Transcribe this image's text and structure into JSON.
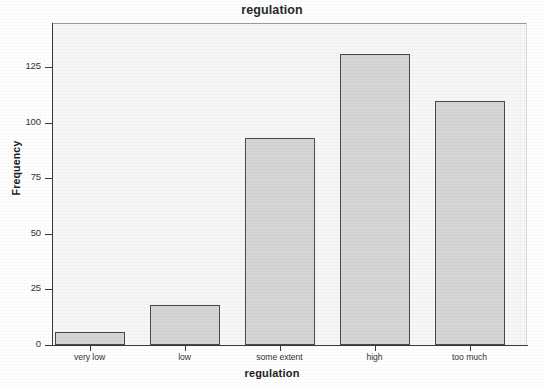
{
  "chart_data": {
    "type": "bar",
    "title": "regulation",
    "xlabel": "regulation",
    "ylabel": "Frequency",
    "categories": [
      "very low",
      "low",
      "some extent",
      "high",
      "too much"
    ],
    "values": [
      6,
      18,
      93,
      131,
      110
    ],
    "ylim": [
      0,
      145
    ],
    "yticks": [
      0,
      25,
      50,
      75,
      100,
      125
    ],
    "ytick_labels": [
      "0",
      "25",
      "50",
      "75",
      "100",
      "125"
    ],
    "grid": false,
    "legend": null,
    "bar_fill_color": "#d6d6d6",
    "bar_border_color": "#4a4a4a",
    "plot_background_color": "#f7f7f7",
    "figure_background_color": "#ffffff",
    "axis_color": "#3b3b3b"
  }
}
